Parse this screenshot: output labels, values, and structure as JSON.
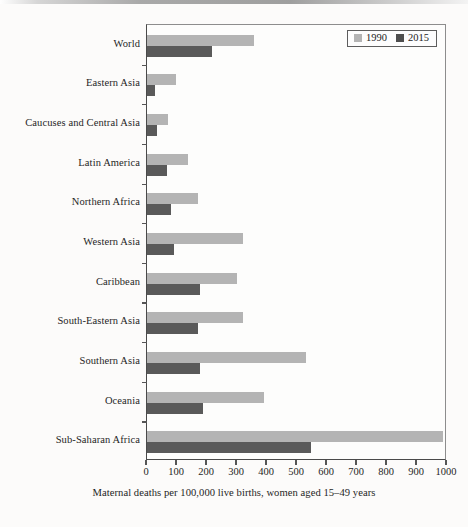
{
  "chart_data": {
    "type": "bar",
    "orientation": "horizontal",
    "title": "",
    "xlabel": "Maternal deaths per 100,000 live births, women aged 15–49 years",
    "ylabel": "",
    "xlim": [
      0,
      1000
    ],
    "xticks": [
      0,
      100,
      200,
      300,
      400,
      500,
      600,
      700,
      800,
      900,
      1000
    ],
    "grid": false,
    "legend_position": "top-right",
    "categories": [
      "World",
      "Eastern Asia",
      "Caucuses and Central Asia",
      "Latin America",
      "Northern Africa",
      "Western Asia",
      "Caribbean",
      "South-Eastern Asia",
      "Southern Asia",
      "Oceania",
      "Sub-Saharan Africa"
    ],
    "series": [
      {
        "name": "1990",
        "color": "#b4b4b4",
        "values": [
          355,
          95,
          70,
          135,
          170,
          320,
          300,
          320,
          530,
          390,
          987
        ]
      },
      {
        "name": "2015",
        "color": "#5a5a5a",
        "values": [
          216,
          27,
          33,
          68,
          80,
          91,
          175,
          170,
          176,
          187,
          546
        ]
      }
    ]
  },
  "legend": {
    "items": [
      {
        "label": "1990",
        "color": "#b4b4b4"
      },
      {
        "label": "2015",
        "color": "#4e4e4e"
      }
    ]
  },
  "axis": {
    "caption": "Maternal deaths per 100,000 live births, women aged 15–49 years"
  }
}
